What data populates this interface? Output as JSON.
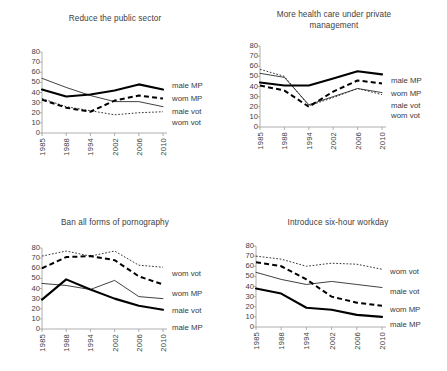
{
  "figure": {
    "title": "",
    "series_labels": {
      "male_mp": "male MP",
      "wom_mp": "wom MP",
      "male_vot": "male vot",
      "wom_vot": "wom vot"
    },
    "yticks": [
      "0",
      "10",
      "20",
      "30",
      "40",
      "50",
      "60",
      "70",
      "80"
    ],
    "xticks": [
      "1985",
      "1988",
      "1994",
      "2002",
      "2006",
      "2010"
    ]
  },
  "chart_data": [
    {
      "type": "line",
      "panel": "top-left",
      "title": "Reduce the public sector",
      "xlabel": "",
      "ylabel": "",
      "categories": [
        "1985",
        "1988",
        "1994",
        "2002",
        "2006",
        "2010"
      ],
      "ylim": [
        0,
        80
      ],
      "yticks": [
        0,
        10,
        20,
        30,
        40,
        50,
        60,
        70,
        80
      ],
      "grid": false,
      "legend": "right-inline",
      "legend_order": [
        "male MP",
        "wom MP",
        "male vot",
        "wom vot"
      ],
      "series": [
        {
          "name": "male MP",
          "values": [
            43,
            36,
            38,
            42,
            48,
            43
          ]
        },
        {
          "name": "wom MP",
          "values": [
            33,
            25,
            21,
            32,
            37,
            34
          ]
        },
        {
          "name": "male vot",
          "values": [
            54,
            45,
            37,
            31,
            31,
            26
          ]
        },
        {
          "name": "wom vot",
          "values": [
            34,
            26,
            22,
            18,
            20,
            21
          ]
        }
      ]
    },
    {
      "type": "line",
      "panel": "top-right",
      "title": "More health care under private\nmanagement",
      "xlabel": "",
      "ylabel": "",
      "categories": [
        "1985",
        "1988",
        "1994",
        "2002",
        "2006",
        "2010"
      ],
      "ylim": [
        0,
        80
      ],
      "yticks": [
        0,
        10,
        20,
        30,
        40,
        50,
        60,
        70,
        80
      ],
      "grid": false,
      "legend": "right-inline",
      "legend_order": [
        "male MP",
        "wom MP",
        "male vot",
        "wom vot"
      ],
      "series": [
        {
          "name": "male MP",
          "values": [
            44,
            41,
            41,
            48,
            55,
            52
          ]
        },
        {
          "name": "wom MP",
          "values": [
            41,
            36,
            20,
            35,
            46,
            43
          ]
        },
        {
          "name": "male vot",
          "values": [
            53,
            49,
            22,
            30,
            38,
            34
          ]
        },
        {
          "name": "wom vot",
          "values": [
            57,
            50,
            21,
            29,
            38,
            32
          ]
        }
      ]
    },
    {
      "type": "line",
      "panel": "bottom-left",
      "title": "Ban all forms of pornography",
      "xlabel": "",
      "ylabel": "",
      "categories": [
        "1985",
        "1988",
        "1994",
        "2002",
        "2006",
        "2010"
      ],
      "ylim": [
        0,
        80
      ],
      "yticks": [
        0,
        10,
        20,
        30,
        40,
        50,
        60,
        70,
        80
      ],
      "grid": false,
      "legend": "right-inline",
      "legend_order": [
        "wom vot",
        "wom MP",
        "male vot",
        "male MP"
      ],
      "series": [
        {
          "name": "wom vot",
          "values": [
            72,
            77,
            72,
            77,
            63,
            61
          ]
        },
        {
          "name": "wom MP",
          "values": [
            60,
            71,
            72,
            68,
            52,
            44
          ]
        },
        {
          "name": "male vot",
          "values": [
            45,
            43,
            39,
            48,
            32,
            30
          ]
        },
        {
          "name": "male MP",
          "values": [
            29,
            49,
            39,
            30,
            23,
            19
          ]
        }
      ]
    },
    {
      "type": "line",
      "panel": "bottom-right",
      "title": "Introduce six-hour workday",
      "xlabel": "",
      "ylabel": "",
      "categories": [
        "1985",
        "1988",
        "1994",
        "2002",
        "2006",
        "2010"
      ],
      "ylim": [
        0,
        80
      ],
      "yticks": [
        0,
        10,
        20,
        30,
        40,
        50,
        60,
        70,
        80
      ],
      "grid": false,
      "legend": "right-inline",
      "legend_order": [
        "wom vot",
        "male vot",
        "wom MP",
        "male MP"
      ],
      "series": [
        {
          "name": "wom vot",
          "values": [
            70,
            67,
            60,
            63,
            62,
            57
          ]
        },
        {
          "name": "male vot",
          "values": [
            54,
            47,
            42,
            45,
            42,
            39
          ]
        },
        {
          "name": "wom MP",
          "values": [
            64,
            60,
            47,
            30,
            24,
            21
          ]
        },
        {
          "name": "male MP",
          "values": [
            38,
            33,
            19,
            17,
            12,
            10
          ]
        }
      ]
    }
  ]
}
